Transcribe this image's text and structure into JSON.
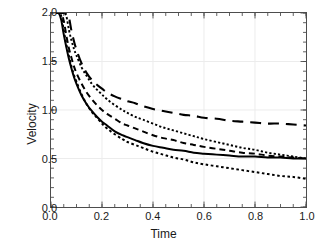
{
  "chart_data": {
    "type": "line",
    "title": "",
    "xlabel": "Time",
    "ylabel": "Velocity",
    "xlim": [
      0.0,
      1.0
    ],
    "ylim": [
      0.0,
      2.0
    ],
    "xticks": [
      "0.0",
      "0.2",
      "0.4",
      "0.6",
      "0.8",
      "1.0"
    ],
    "xtick_values": [
      0.0,
      0.2,
      0.4,
      0.6,
      0.8,
      1.0
    ],
    "yticks": [
      "0.0",
      "0.5",
      "1.0",
      "1.5",
      "2.0"
    ],
    "ytick_values": [
      0.0,
      0.5,
      1.0,
      1.5,
      2.0
    ],
    "x_minor_step": 0.05,
    "y_minor_step": 0.1,
    "grid": true,
    "grid_color": "#ececec",
    "legend": "none",
    "line_color": "#000000",
    "x": [
      0.02,
      0.03,
      0.04,
      0.05,
      0.06,
      0.07,
      0.08,
      0.09,
      0.1,
      0.12,
      0.14,
      0.16,
      0.18,
      0.2,
      0.22,
      0.25,
      0.28,
      0.3,
      0.33,
      0.36,
      0.4,
      0.44,
      0.48,
      0.52,
      0.56,
      0.6,
      0.65,
      0.7,
      0.75,
      0.8,
      0.85,
      0.9,
      0.95,
      1.0
    ],
    "series": [
      {
        "name": "curve-long-dash",
        "style": "long-dash",
        "dash": "11,7",
        "width": 2.1,
        "values": [
          2.0,
          2.0,
          2.0,
          2.0,
          2.0,
          1.96,
          1.82,
          1.71,
          1.62,
          1.48,
          1.38,
          1.31,
          1.26,
          1.22,
          1.18,
          1.14,
          1.11,
          1.09,
          1.07,
          1.04,
          1.01,
          0.99,
          0.97,
          0.95,
          0.94,
          0.92,
          0.91,
          0.89,
          0.88,
          0.87,
          0.86,
          0.86,
          0.85,
          0.84
        ]
      },
      {
        "name": "curve-fine-dot",
        "style": "fine-dot",
        "dash": "2.2,2.2",
        "width": 1.9,
        "values": [
          2.0,
          2.0,
          2.0,
          2.0,
          1.97,
          1.83,
          1.72,
          1.63,
          1.56,
          1.44,
          1.35,
          1.27,
          1.21,
          1.16,
          1.11,
          1.05,
          1.0,
          0.97,
          0.93,
          0.9,
          0.86,
          0.82,
          0.79,
          0.76,
          0.73,
          0.7,
          0.67,
          0.64,
          0.61,
          0.59,
          0.56,
          0.54,
          0.52,
          0.5
        ]
      },
      {
        "name": "curve-short-dash",
        "style": "short-dash",
        "dash": "6,4",
        "width": 2.0,
        "values": [
          2.0,
          2.0,
          2.0,
          1.92,
          1.77,
          1.64,
          1.54,
          1.45,
          1.38,
          1.27,
          1.18,
          1.11,
          1.05,
          1.0,
          0.96,
          0.91,
          0.86,
          0.84,
          0.81,
          0.78,
          0.74,
          0.71,
          0.69,
          0.66,
          0.64,
          0.62,
          0.6,
          0.58,
          0.56,
          0.55,
          0.53,
          0.52,
          0.51,
          0.5
        ]
      },
      {
        "name": "curve-solid",
        "style": "solid",
        "dash": "none",
        "width": 2.0,
        "values": [
          2.0,
          2.0,
          1.93,
          1.78,
          1.65,
          1.53,
          1.43,
          1.34,
          1.27,
          1.15,
          1.06,
          0.99,
          0.93,
          0.88,
          0.84,
          0.78,
          0.74,
          0.72,
          0.69,
          0.66,
          0.63,
          0.61,
          0.59,
          0.58,
          0.56,
          0.55,
          0.54,
          0.53,
          0.52,
          0.52,
          0.51,
          0.51,
          0.5,
          0.5
        ]
      },
      {
        "name": "curve-coarse-dot",
        "style": "coarse-dot",
        "dash": "2.6,2.6",
        "width": 2.0,
        "values": [
          2.0,
          2.0,
          1.97,
          1.82,
          1.68,
          1.56,
          1.45,
          1.36,
          1.29,
          1.16,
          1.06,
          0.98,
          0.92,
          0.86,
          0.81,
          0.75,
          0.7,
          0.67,
          0.64,
          0.61,
          0.57,
          0.54,
          0.51,
          0.49,
          0.46,
          0.44,
          0.42,
          0.4,
          0.38,
          0.36,
          0.34,
          0.32,
          0.31,
          0.29
        ]
      }
    ]
  }
}
